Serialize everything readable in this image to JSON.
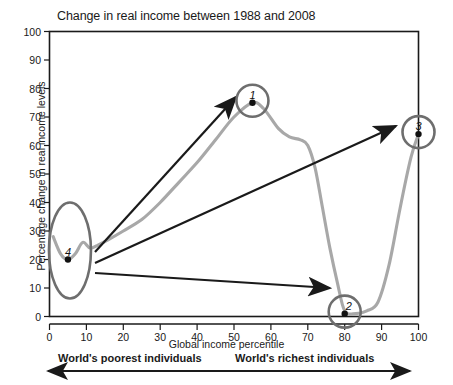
{
  "chart_data": {
    "type": "line",
    "title": "Change in real income between 1988 and 2008",
    "xlabel": "Global income percentile",
    "ylabel": "Percentage change in real income levels",
    "xlim": [
      0,
      100
    ],
    "ylim": [
      0,
      100
    ],
    "xticks": [
      "0",
      "10",
      "20",
      "30",
      "40",
      "50",
      "60",
      "70",
      "80",
      "90",
      "100"
    ],
    "yticks": [
      "0",
      "10",
      "20",
      "30",
      "40",
      "50",
      "60",
      "70",
      "80",
      "90",
      "100"
    ],
    "grid": false,
    "legend": "none",
    "series": [
      {
        "name": "Change in real income 1988-2008",
        "color": "#a8a8a8",
        "x": [
          1,
          3,
          5,
          7,
          9,
          11,
          13,
          16,
          20,
          25,
          30,
          35,
          40,
          45,
          50,
          55,
          58,
          62,
          65,
          68,
          70,
          72,
          74,
          76,
          78,
          80,
          83,
          86,
          89,
          92,
          95,
          98,
          100
        ],
        "y": [
          28,
          22,
          20,
          22,
          26,
          24,
          25,
          27,
          30,
          34,
          40,
          47,
          54,
          62,
          70,
          75,
          73,
          66,
          63,
          62,
          60,
          52,
          38,
          24,
          12,
          2,
          1,
          2,
          5,
          18,
          38,
          56,
          64
        ]
      }
    ],
    "markers": [
      {
        "label": "1",
        "x": 55,
        "y": 75,
        "shape": "circle",
        "note": "Peak: emerging middle class"
      },
      {
        "label": "2",
        "x": 80,
        "y": 1,
        "shape": "circle",
        "note": "Trough: rich-world lower middle class"
      },
      {
        "label": "3",
        "x": 100,
        "y": 64,
        "shape": "circle",
        "note": "Global top 1%"
      },
      {
        "label": "4",
        "x": 5,
        "y": 20,
        "shape": "ellipse",
        "note": "World's poorest"
      }
    ],
    "arrows": [
      {
        "from_label": "4",
        "to_label": "1"
      },
      {
        "from_label": "4",
        "to_label": "3"
      },
      {
        "from_label": "4",
        "to_label": "2"
      }
    ],
    "annotations": {
      "left": "World's poorest individuals",
      "right": "World's richest individuals",
      "axis_arrow": "double-headed"
    }
  },
  "colors": {
    "curve": "#a8a8a8",
    "marker_ring": "#6e6e6e",
    "arrow": "#1a1a1a",
    "axis": "#1a1a1a",
    "text": "#1a1a1a"
  }
}
